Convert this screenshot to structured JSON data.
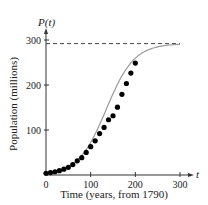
{
  "chart_data": {
    "type": "scatter",
    "title": "",
    "xlabel": "Time (years, from 1790)",
    "ylabel": "Population (millions)",
    "y_axis_symbol": "P(t)",
    "x_axis_symbol": "t",
    "xlim": [
      0,
      300
    ],
    "ylim": [
      0,
      300
    ],
    "x_ticks": [
      "0",
      "100",
      "200",
      "300"
    ],
    "y_ticks": [
      "100",
      "200",
      "300"
    ],
    "grid": false,
    "legend": "none",
    "series": [
      {
        "name": "Census data",
        "kind": "points",
        "x": [
          0,
          10,
          20,
          30,
          40,
          50,
          60,
          70,
          80,
          90,
          100,
          110,
          120,
          130,
          140,
          150,
          160,
          170,
          180,
          190,
          200
        ],
        "y": [
          3.9,
          5.3,
          7.2,
          9.6,
          12.9,
          17.1,
          23.2,
          31.4,
          38.6,
          50.2,
          62.9,
          76.0,
          92.0,
          105.7,
          122.8,
          131.7,
          150.7,
          179.3,
          203.3,
          226.5,
          248.7
        ]
      },
      {
        "name": "Logistic model",
        "kind": "curve",
        "carrying_capacity": 292,
        "color": "#999999"
      },
      {
        "name": "Carrying capacity",
        "kind": "dashed-horizontal",
        "y": 292
      }
    ]
  }
}
